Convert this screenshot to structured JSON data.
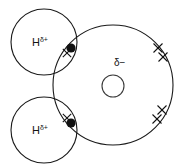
{
  "figure": {
    "background_color": "#ffffff",
    "stroke_color": "#111111",
    "width": 176,
    "height": 168
  },
  "atoms": {
    "hydrogen_top": {
      "element": "H",
      "charge": "δ+",
      "cx": 44,
      "cy": 42,
      "r": 33
    },
    "hydrogen_bottom": {
      "element": "H",
      "charge": "δ+",
      "cx": 44,
      "cy": 130,
      "r": 33
    },
    "oxygen": {
      "charge": "δ−",
      "cx": 113,
      "cy": 85,
      "r": 60,
      "nucleus_r": 11,
      "nucleus_cx": 113,
      "nucleus_cy": 86,
      "label_x": 124,
      "label_y": 62
    }
  },
  "bond_dots": [
    {
      "name": "shared-electron-top",
      "cx": 71,
      "cy": 48,
      "r": 4.6
    },
    {
      "name": "shared-electron-bottom",
      "cx": 71,
      "cy": 123,
      "r": 4.6
    }
  ],
  "lone_pair_crosses": [
    {
      "name": "lone-pair-electron-1",
      "cx": 158,
      "cy": 48,
      "size": 4.5
    },
    {
      "name": "lone-pair-electron-2",
      "cx": 163,
      "cy": 57,
      "size": 4.5
    },
    {
      "name": "lone-pair-electron-3",
      "cx": 162,
      "cy": 110,
      "size": 4.5
    },
    {
      "name": "lone-pair-electron-4",
      "cx": 157,
      "cy": 119,
      "size": 4.5
    }
  ],
  "bond_crosses": [
    {
      "name": "bond-electron-cross-top",
      "cx": 67,
      "cy": 53,
      "size": 4.2
    },
    {
      "name": "bond-electron-cross-bottom",
      "cx": 67,
      "cy": 118,
      "size": 4.2
    }
  ]
}
